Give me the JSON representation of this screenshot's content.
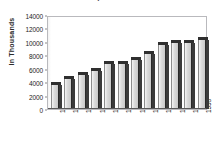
{
  "chart_data": {
    "type": "bar",
    "title": "Population",
    "subtitle": "",
    "xlabel": "",
    "ylabel": "In  Thousands",
    "categories": [
      "1890",
      "1900",
      "1910",
      "1920",
      "1930",
      "1940",
      "1950",
      "1960",
      "1970",
      "1980",
      "1990",
      "1998"
    ],
    "values": [
      3600,
      4400,
      5000,
      5600,
      6700,
      6700,
      7300,
      8200,
      9600,
      9900,
      9900,
      10300
    ],
    "series": [
      {
        "name": "Population",
        "values": [
          3600,
          4400,
          5000,
          5600,
          6700,
          6700,
          7300,
          8200,
          9600,
          9900,
          9900,
          10300
        ]
      }
    ],
    "ylim": [
      0,
      14000
    ],
    "yticks": [
      0,
      2000,
      4000,
      6000,
      8000,
      10000,
      12000,
      14000
    ],
    "ytick_labels": [
      "0",
      "2000",
      "4000",
      "6000",
      "8000",
      "10000",
      "12000",
      "14000"
    ],
    "grid": false,
    "legend": false,
    "legend_position": "none",
    "bar_style": "3d-column",
    "colors": {
      "bar_face": "#d8d8d8",
      "bar_shadow": "#3b3b3b",
      "bar_top": "#2f2f2f",
      "frame": "#b9b9bd",
      "axis_text": "#1d1d1d",
      "plot_background": "#ffffff",
      "page_background": "#ffffff",
      "title": "#4a4a55"
    }
  }
}
